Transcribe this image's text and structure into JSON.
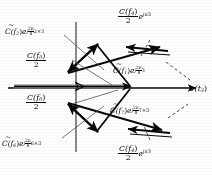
{
  "figure": {
    "ink_color": "#111111",
    "paper_color": "#fbfbfa",
    "gray_accent": "#8a8a8a"
  },
  "axes": {
    "horizontal_label": "v(t",
    "horizontal_label_sub": "3",
    "horizontal_label_tail": ")",
    "vertical_name": "imaginary-axis",
    "horizontal_name": "real-axis"
  },
  "labels": {
    "c2": {
      "base": "C(f",
      "base_sub": "2",
      "base_tail": ")",
      "exp_e": "e",
      "exp_j": "j",
      "exp_num": "2π",
      "exp_den": "8",
      "exp_tail": "2×3",
      "full": "C̃(f2) e^{j(2π/8)2×3}"
    },
    "c6": {
      "base": "C(f",
      "base_sub": "6",
      "base_tail": ")",
      "exp_e": "e",
      "exp_j": "j",
      "exp_num": "2π",
      "exp_den": "8",
      "exp_tail": "6×3",
      "full": "C̃(f6) e^{j(2π/8)6×3}"
    },
    "c1": {
      "base": "C(f",
      "base_sub": "1",
      "base_tail": ")",
      "exp_e": "e",
      "exp_j": "j",
      "exp_num": "2π",
      "exp_den": "8",
      "exp_tail": "3",
      "full": "C̃(f1) e^{j(2π/8)3}"
    },
    "c7": {
      "base": "C(f",
      "base_sub": "7",
      "base_tail": ")",
      "exp_e": "e",
      "exp_j": "j",
      "exp_num": "2π",
      "exp_den": "8",
      "exp_tail": "7×3",
      "full": "C̃(f7) e^{j(2π/8)7×3}"
    },
    "c0_upper": {
      "num": "C(f",
      "num_sub": "0",
      "num_tail": ")",
      "den": "2",
      "full": "C(f0)/2"
    },
    "c0_lower": {
      "num": "C(f",
      "num_sub": "0",
      "num_tail": ")",
      "den": "2",
      "full": "C(f0)/2"
    },
    "c4_upper": {
      "num": "C(f",
      "num_sub": "4",
      "num_tail": ")",
      "den": "2",
      "exp_e": "e",
      "exp_j": "j",
      "exp_tail": "π3",
      "full": "C(f4)/2 e^{jπ3}"
    },
    "c4_lower": {
      "num": "C(f",
      "num_sub": "4",
      "num_tail": ")",
      "den": "2",
      "exp_e": "e",
      "exp_j": "j",
      "exp_tail": "π3",
      "full": "C(f4)/2 e^{jπ3}"
    }
  }
}
